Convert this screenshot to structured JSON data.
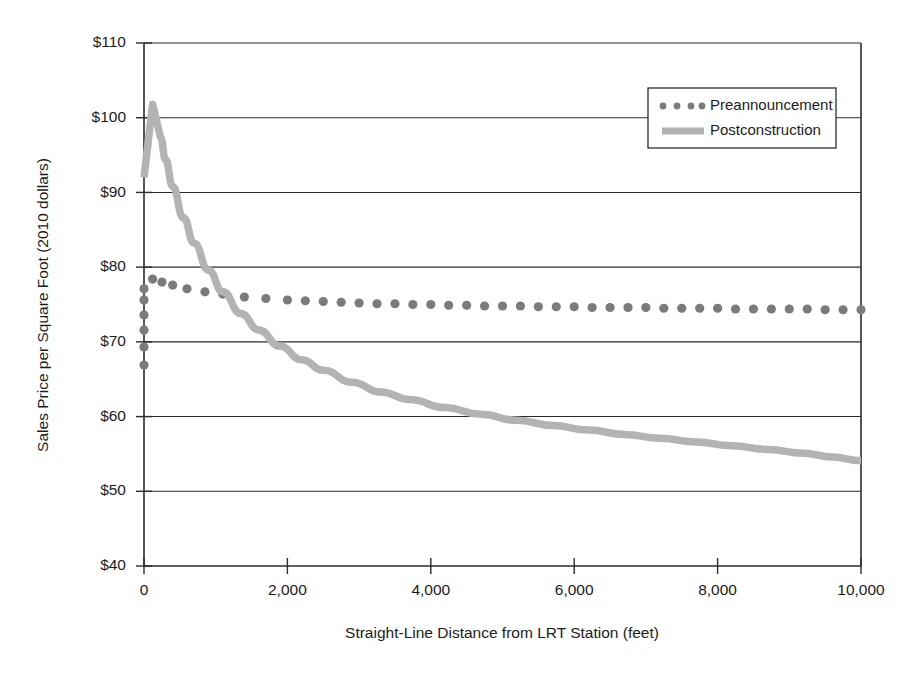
{
  "chart_data": {
    "type": "line",
    "title": "",
    "subtitle": "",
    "xlabel": "Straight-Line Distance from LRT Station (feet)",
    "ylabel": "Sales Price per Square Foot (2010 dollars)",
    "xlim": [
      0,
      10000
    ],
    "ylim": [
      40,
      110
    ],
    "xticks": [
      0,
      2000,
      4000,
      6000,
      8000,
      10000
    ],
    "xtick_labels": [
      "0",
      "2,000",
      "4,000",
      "6,000",
      "8,000",
      "10,000"
    ],
    "yticks": [
      40,
      50,
      60,
      70,
      80,
      90,
      100,
      110
    ],
    "ytick_labels": [
      "$40",
      "$50",
      "$60",
      "$70",
      "$80",
      "$90",
      "$100",
      "$110"
    ],
    "grid": "horizontal",
    "legend_position": "top-right",
    "legend_entries": [
      {
        "name": "Preannouncement",
        "marker": "dotted",
        "color": "#7b7b7b"
      },
      {
        "name": "Postconstruction",
        "marker": "solid-band",
        "color": "#b3b3b3"
      }
    ],
    "series": [
      {
        "name": "Preannouncement",
        "style": "dotted",
        "color": "#7b7b7b",
        "x": [
          0,
          0,
          0,
          0,
          0,
          0,
          120,
          250,
          400,
          600,
          850,
          1100,
          1400,
          1700,
          2000,
          2250,
          2500,
          2750,
          3000,
          3250,
          3500,
          3750,
          4000,
          4250,
          4500,
          4750,
          5000,
          5250,
          5500,
          5750,
          6000,
          6250,
          6500,
          6750,
          7000,
          7250,
          7500,
          7750,
          8000,
          8250,
          8500,
          8750,
          9000,
          9250,
          9500,
          9750,
          10000
        ],
        "y": [
          66.9,
          69.3,
          71.6,
          73.6,
          75.6,
          77.1,
          78.4,
          78.0,
          77.6,
          77.1,
          76.7,
          76.4,
          76.0,
          75.8,
          75.6,
          75.5,
          75.4,
          75.3,
          75.2,
          75.1,
          75.1,
          75.0,
          75.0,
          74.9,
          74.9,
          74.8,
          74.8,
          74.8,
          74.7,
          74.7,
          74.7,
          74.6,
          74.6,
          74.6,
          74.6,
          74.5,
          74.5,
          74.5,
          74.5,
          74.4,
          74.4,
          74.4,
          74.4,
          74.4,
          74.3,
          74.3,
          74.3
        ]
      },
      {
        "name": "Postconstruction",
        "style": "solid-band",
        "color": "#b3b3b3",
        "x": [
          0,
          120,
          230,
          300,
          400,
          550,
          700,
          900,
          1100,
          1350,
          1600,
          1900,
          2200,
          2500,
          2900,
          3300,
          3700,
          4200,
          4700,
          5200,
          5700,
          6200,
          6700,
          7200,
          7700,
          8200,
          8700,
          9200,
          9600,
          10000
        ],
        "y": [
          92.0,
          101.8,
          97.4,
          94.4,
          90.8,
          86.6,
          83.2,
          79.6,
          76.7,
          73.8,
          71.6,
          69.4,
          67.6,
          66.2,
          64.6,
          63.3,
          62.3,
          61.2,
          60.3,
          59.5,
          58.8,
          58.2,
          57.6,
          57.1,
          56.6,
          56.1,
          55.6,
          55.1,
          54.6,
          54.1
        ]
      }
    ]
  },
  "axes": {
    "ylabel": "Sales Price per Square Foot (2010 dollars)",
    "xlabel": "Straight-Line Distance from LRT Station (feet)"
  },
  "legend": {
    "item_preannouncement": "Preannouncement",
    "item_postconstruction": "Postconstruction"
  }
}
